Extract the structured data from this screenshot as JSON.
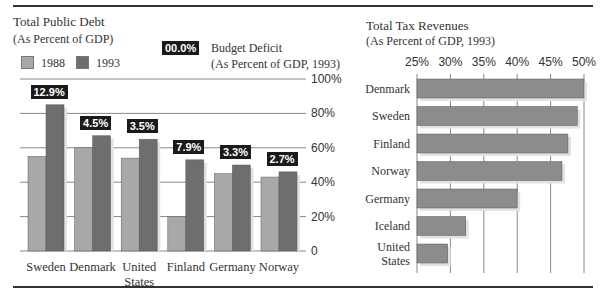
{
  "colors": {
    "bar_1988": "#a8a8a8",
    "bar_1993": "#6e6e6e",
    "bar_tax": "#8c8c8c",
    "gridline": "#888888",
    "deficit_box": "#1a1a1a",
    "deficit_text": "#ffffff"
  },
  "chart_data": [
    {
      "type": "bar",
      "title": "Total Public Debt",
      "subtitle": "(As Percent of GDP)",
      "categories": [
        "Sweden",
        "Denmark",
        "United States",
        "Finland",
        "Germany",
        "Norway"
      ],
      "category_lines": [
        [
          "Sweden"
        ],
        [
          "Denmark"
        ],
        [
          "United",
          "States"
        ],
        [
          "Finland"
        ],
        [
          "Germany"
        ],
        [
          "Norway"
        ]
      ],
      "series": [
        {
          "name": "1988",
          "values": [
            55,
            60,
            54,
            20,
            45,
            43
          ]
        },
        {
          "name": "1993",
          "values": [
            85,
            67,
            65,
            53,
            50,
            46
          ]
        }
      ],
      "annotations": {
        "name": "Budget Deficit",
        "subtitle": "(As Percent of GDP, 1993)",
        "legend_sample": "00.0%",
        "values": [
          "12.9%",
          "4.5%",
          "3.5%",
          "7.9%",
          "3.3%",
          "2.7%"
        ]
      },
      "ylim": [
        0,
        100
      ],
      "yticks": [
        0,
        20,
        40,
        60,
        80,
        100
      ],
      "ytick_labels": [
        "0",
        "20%",
        "40%",
        "60%",
        "80%",
        "100%"
      ],
      "y_axis_side": "right",
      "grid": true,
      "legend": "top-left"
    },
    {
      "type": "bar",
      "orientation": "horizontal",
      "title": "Total Tax Revenues",
      "subtitle": "(As Percent of GDP, 1993)",
      "categories": [
        "Denmark",
        "Sweden",
        "Finland",
        "Norway",
        "Germany",
        "Iceland",
        "United States"
      ],
      "category_lines": [
        [
          "Denmark"
        ],
        [
          "Sweden"
        ],
        [
          "Finland"
        ],
        [
          "Norway"
        ],
        [
          "Germany"
        ],
        [
          "Iceland"
        ],
        [
          "United",
          "States"
        ]
      ],
      "values": [
        50.0,
        49.0,
        47.6,
        46.7,
        40.0,
        32.3,
        29.6
      ],
      "xlim": [
        25,
        50
      ],
      "xticks": [
        25,
        30,
        35,
        40,
        45,
        50
      ],
      "xtick_labels": [
        "25%",
        "30%",
        "35%",
        "40%",
        "45%",
        "50%"
      ],
      "x_axis_side": "top",
      "grid": true
    }
  ]
}
